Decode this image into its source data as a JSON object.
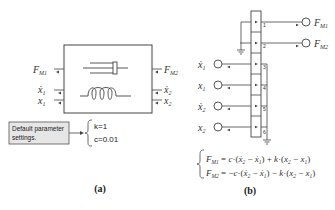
{
  "panel_a": {
    "caption": "(a)",
    "left_ports": [
      "F_M1",
      "ẋ1",
      "x1"
    ],
    "right_ports": [
      "F_M2",
      "ẋ2",
      "x2"
    ],
    "note": {
      "line1": "Default parameter",
      "line2": "settings."
    },
    "params": {
      "k": "k=1",
      "c": "c=0.01"
    }
  },
  "panel_b": {
    "caption": "(b)",
    "outputs": [
      "F_M1",
      "F_M2"
    ],
    "inputs": [
      "ẋ1",
      "x1",
      "ẋ2",
      "x2"
    ],
    "port_numbers": [
      "1",
      "2",
      "3",
      "4",
      "5",
      "6"
    ],
    "equations": {
      "eq1": "F_M1 = c·(ẋ2 − ẋ1) + k·(x2 − x1)",
      "eq2": "F_M2 = −c·(ẋ2 − ẋ1) − k·(x2 − x1)"
    }
  },
  "colors": {
    "line": "#444444",
    "note_fill": "#e6e6e6"
  }
}
